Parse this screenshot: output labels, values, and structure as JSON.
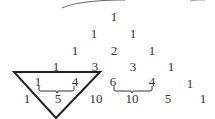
{
  "diagram": {
    "rows": [
      [
        "1"
      ],
      [
        "1",
        "1"
      ],
      [
        "1",
        "2",
        "1"
      ],
      [
        "1",
        "3",
        "3",
        "1"
      ],
      [
        "1",
        "4",
        "6",
        "4",
        "1"
      ],
      [
        "1",
        "5",
        "10",
        "10",
        "5",
        "1"
      ]
    ],
    "annotations": [
      {
        "type": "inverted-triangle",
        "encloses": [
          "1",
          "3",
          "1",
          "4",
          "5"
        ]
      },
      {
        "type": "brace",
        "from": "1",
        "to": "4",
        "sum": "5"
      },
      {
        "type": "brace",
        "from": "6",
        "to": "4",
        "sum": "10"
      }
    ],
    "colors": {
      "text": "#333333",
      "stroke": "#222222"
    }
  }
}
